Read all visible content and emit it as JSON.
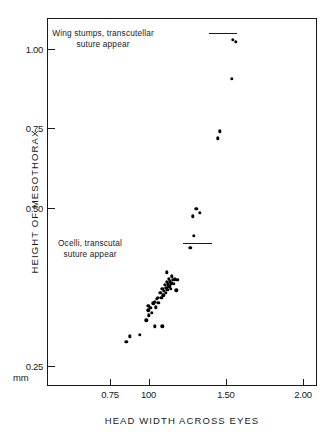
{
  "chart_data": {
    "type": "scatter",
    "title": "",
    "xlabel": "HEAD WIDTH ACROSS EYES",
    "ylabel": "HEIGHT OF MESOTHORAX",
    "yunit": "mm",
    "xticks": [
      "0.75",
      "100",
      "1.50",
      "2.00"
    ],
    "xtick_values": [
      0.75,
      1.0,
      1.5,
      2.0
    ],
    "yticks": [
      "1.00",
      "0.75",
      "0.50",
      "0.25"
    ],
    "ytick_values": [
      1.0,
      0.75,
      0.5,
      0.25
    ],
    "xlim": [
      0.63,
      2.12
    ],
    "ylim": [
      0.235,
      1.06
    ],
    "grid": false,
    "legend": null,
    "annotations": [
      {
        "name": "wing-stumps-annotation",
        "line1": "Wing stumps, transcutellar",
        "line2": "suture appear",
        "points_to": [
          1.545,
          1.03
        ]
      },
      {
        "name": "ocelli-annotation",
        "line1": "Ocelli, transcutal",
        "line2": "suture appear",
        "points_to": [
          1.27,
          0.437
        ]
      }
    ],
    "points": [
      [
        0.855,
        0.288
      ],
      [
        0.88,
        0.297
      ],
      [
        0.945,
        0.299
      ],
      [
        0.985,
        0.322
      ],
      [
        1.0,
        0.33
      ],
      [
        0.997,
        0.338
      ],
      [
        0.998,
        0.345
      ],
      [
        1.012,
        0.342
      ],
      [
        1.022,
        0.334
      ],
      [
        1.03,
        0.349
      ],
      [
        1.04,
        0.352
      ],
      [
        1.045,
        0.343
      ],
      [
        1.052,
        0.356
      ],
      [
        1.06,
        0.358
      ],
      [
        1.063,
        0.35
      ],
      [
        1.075,
        0.366
      ],
      [
        1.082,
        0.358
      ],
      [
        1.088,
        0.372
      ],
      [
        1.094,
        0.362
      ],
      [
        1.1,
        0.369
      ],
      [
        1.104,
        0.378
      ],
      [
        1.11,
        0.366
      ],
      [
        1.115,
        0.374
      ],
      [
        1.118,
        0.383
      ],
      [
        1.122,
        0.371
      ],
      [
        1.126,
        0.379
      ],
      [
        1.131,
        0.388
      ],
      [
        1.134,
        0.376
      ],
      [
        1.138,
        0.384
      ],
      [
        1.142,
        0.372
      ],
      [
        1.147,
        0.381
      ],
      [
        1.15,
        0.392
      ],
      [
        1.118,
        0.398
      ],
      [
        1.156,
        0.386
      ],
      [
        1.162,
        0.38
      ],
      [
        1.17,
        0.387
      ],
      [
        1.186,
        0.386
      ],
      [
        1.18,
        0.37
      ],
      [
        1.04,
        0.313
      ],
      [
        1.088,
        0.313
      ],
      [
        1.27,
        0.437
      ],
      [
        1.292,
        0.456
      ],
      [
        1.286,
        0.487
      ],
      [
        1.308,
        0.499
      ],
      [
        1.33,
        0.492
      ],
      [
        1.448,
        0.718
      ],
      [
        1.462,
        0.74
      ],
      [
        1.54,
        0.905
      ],
      [
        1.545,
        1.03
      ],
      [
        1.565,
        1.022
      ]
    ]
  }
}
